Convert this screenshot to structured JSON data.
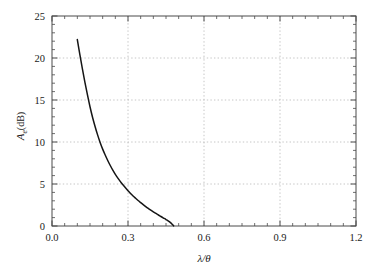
{
  "chart_data": {
    "type": "line",
    "title": "",
    "subtitle": "",
    "xlabel": "λ/θ",
    "xlabel_parts": {
      "numerator": "λ",
      "slash": "/",
      "denominator": "θ"
    },
    "ylabel": "Aₑ(dB)",
    "ylabel_parts": {
      "symbol": "A",
      "subscript": "e",
      "unit": "(dB)"
    },
    "xlim": [
      0.0,
      1.2
    ],
    "ylim": [
      0,
      25
    ],
    "xticks": [
      0.0,
      0.3,
      0.6,
      0.9,
      1.2
    ],
    "xtick_labels": [
      "0.0",
      "0.3",
      "0.6",
      "0.9",
      "1.2"
    ],
    "yticks": [
      0,
      5,
      10,
      15,
      20,
      25
    ],
    "ytick_labels": [
      "0",
      "5",
      "10",
      "15",
      "20",
      "25"
    ],
    "x_minor_per_major": 6,
    "y_minor_per_major": 5,
    "grid": true,
    "grid_style": "dotted",
    "grid_color": "#b8b8b8",
    "legend": null,
    "legend_position": "none",
    "series": [
      {
        "name": "Ae",
        "color": "#151515",
        "x": [
          0.1,
          0.11,
          0.12,
          0.13,
          0.14,
          0.15,
          0.16,
          0.17,
          0.18,
          0.19,
          0.2,
          0.21,
          0.22,
          0.23,
          0.24,
          0.25,
          0.26,
          0.27,
          0.28,
          0.29,
          0.3,
          0.31,
          0.32,
          0.33,
          0.34,
          0.35,
          0.36,
          0.37,
          0.38,
          0.39,
          0.4,
          0.41,
          0.42,
          0.43,
          0.44,
          0.45,
          0.46,
          0.47,
          0.48
        ],
        "y": [
          22.2,
          20.4,
          18.7,
          17.1,
          15.6,
          14.2,
          12.95,
          11.85,
          10.85,
          9.95,
          9.15,
          8.45,
          7.8,
          7.2,
          6.65,
          6.15,
          5.7,
          5.28,
          4.9,
          4.54,
          4.2,
          3.88,
          3.58,
          3.3,
          3.03,
          2.78,
          2.54,
          2.31,
          2.09,
          1.88,
          1.68,
          1.49,
          1.31,
          1.13,
          0.95,
          0.77,
          0.58,
          0.34,
          0.02
        ]
      }
    ],
    "annotations": []
  }
}
